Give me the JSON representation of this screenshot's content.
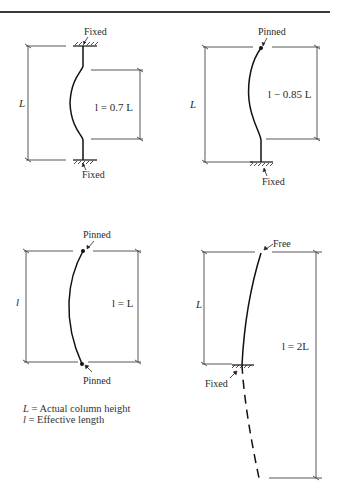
{
  "figure": {
    "panels": [
      {
        "id": "fixed-fixed",
        "top_support": "Fixed",
        "bottom_support": "Fixed",
        "actual_height_label": "L",
        "effective_length_label": "l = 0.7 L",
        "effective_length_factor": 0.7
      },
      {
        "id": "pinned-fixed",
        "top_support": "Pinned",
        "bottom_support": "Fixed",
        "actual_height_label": "L",
        "effective_length_label": "l − 0.85 L",
        "effective_length_factor": 0.85
      },
      {
        "id": "pinned-pinned",
        "top_support": "Pinned",
        "bottom_support": "Pinned",
        "actual_height_label": "l",
        "effective_length_label": "l = L",
        "effective_length_factor": 1.0
      },
      {
        "id": "free-fixed",
        "top_support": "Free",
        "bottom_support": "Fixed",
        "actual_height_label": "L",
        "effective_length_label": "l = 2L",
        "effective_length_factor": 2.0
      }
    ],
    "legend": {
      "line1_symbol": "L",
      "line1_text": " = Actual column height",
      "line2_symbol": "l",
      "line2_text": " = Effective length"
    }
  }
}
